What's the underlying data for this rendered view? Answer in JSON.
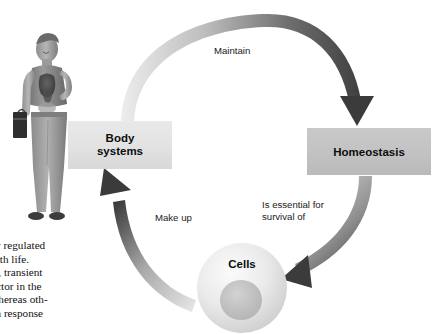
{
  "figure": {
    "caption_title": "dy",
    "caption_sub_lines": [
      "or",
      "s"
    ]
  },
  "diagram": {
    "nodes": [
      {
        "id": "body-systems",
        "label_line1": "Body",
        "label_line2": "systems",
        "fill": "#e2e2e2"
      },
      {
        "id": "homeostasis",
        "label": "Homeostasis",
        "fill": "#c2c2c2"
      },
      {
        "id": "cells",
        "label": "Cells",
        "fill": "#e0e0e0"
      }
    ],
    "arrows": [
      {
        "id": "maintain",
        "label": "Maintain",
        "from": "body-systems",
        "to": "homeostasis"
      },
      {
        "id": "essential",
        "label_line1": "Is essential for",
        "label_line2": "survival of",
        "from": "homeostasis",
        "to": "cells"
      },
      {
        "id": "make-up",
        "label": "Make up",
        "from": "cells",
        "to": "body-systems"
      }
    ],
    "arrow_color_light": "#e6e6e6",
    "arrow_color_dark": "#4a4a4a"
  },
  "body_text": {
    "lines": [
      "arefully  regulated",
      "tible with life.",
      "nediate,  transient",
      "ated  factor  in  the",
      "evel, whereas oth-",
      "place in response"
    ]
  },
  "illustration": {
    "name": "standing-man-with-briefcase-anatomy"
  }
}
